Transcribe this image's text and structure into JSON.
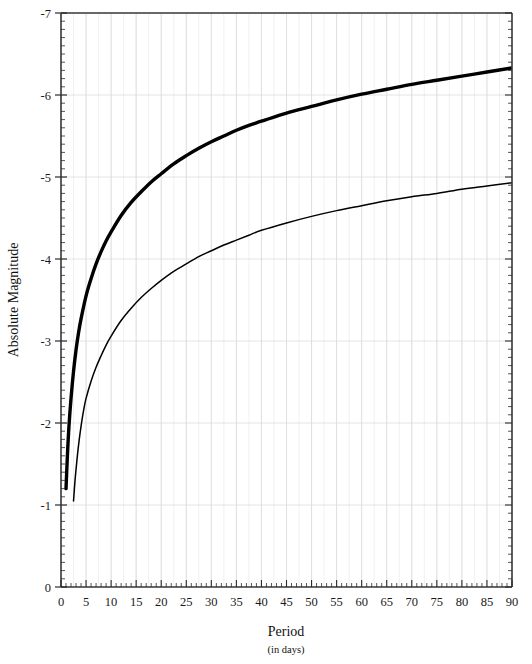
{
  "chart_data": {
    "type": "line",
    "title": "",
    "xlabel": "Period",
    "xlabel_sub": "(in days)",
    "ylabel": "Absolute Magnitude",
    "xlim": [
      0,
      90
    ],
    "ylim": [
      0,
      -7
    ],
    "y_inverted": true,
    "grid": true,
    "grid_color": "#d8d8d8",
    "legend": "none",
    "x_ticks": [
      0,
      5,
      10,
      15,
      20,
      25,
      30,
      35,
      40,
      45,
      50,
      55,
      60,
      65,
      70,
      75,
      80,
      85,
      90
    ],
    "x_tick_labels": [
      "0",
      "5",
      "10",
      "15",
      "20",
      "25",
      "30",
      "35",
      "40",
      "45",
      "50",
      "55",
      "60",
      "65",
      "70",
      "75",
      "80",
      "85",
      "90"
    ],
    "x_minor_interval": 1,
    "y_ticks": [
      0,
      -1,
      -2,
      -3,
      -4,
      -5,
      -6,
      -7
    ],
    "y_tick_labels": [
      "0",
      "-1",
      "-2",
      "-3",
      "-4",
      "-5",
      "-6",
      "-7"
    ],
    "y_minor_interval": 0.1,
    "series": [
      {
        "name": "Type I Cepheids",
        "style": "thick",
        "color": "#000000",
        "width": 3.4,
        "x": [
          1,
          1.3,
          1.6,
          2,
          2.5,
          3,
          3.5,
          4,
          5,
          6,
          7,
          8,
          9,
          10,
          12,
          14,
          16,
          18,
          20,
          22.5,
          25,
          27.5,
          30,
          32.5,
          35,
          37.5,
          40,
          45,
          50,
          55,
          60,
          65,
          70,
          75,
          80,
          85,
          90
        ],
        "y": [
          -1.2,
          -1.63,
          -1.97,
          -2.3,
          -2.63,
          -2.89,
          -3.1,
          -3.27,
          -3.55,
          -3.76,
          -3.94,
          -4.09,
          -4.22,
          -4.33,
          -4.53,
          -4.69,
          -4.82,
          -4.94,
          -5.04,
          -5.16,
          -5.26,
          -5.35,
          -5.43,
          -5.5,
          -5.57,
          -5.63,
          -5.68,
          -5.78,
          -5.86,
          -5.94,
          -6.01,
          -6.07,
          -6.13,
          -6.18,
          -6.23,
          -6.28,
          -6.33
        ]
      },
      {
        "name": "Type II Cepheids / RR Lyrae",
        "style": "thin",
        "color": "#000000",
        "width": 1.5,
        "x": [
          2.5,
          2.8,
          3.2,
          3.6,
          4,
          4.5,
          5,
          6,
          7,
          8,
          9,
          10,
          12,
          14,
          16,
          18,
          20,
          22.5,
          25,
          27.5,
          30,
          32.5,
          35,
          37.5,
          40,
          45,
          50,
          55,
          60,
          65,
          70,
          75,
          80,
          85,
          90
        ],
        "y": [
          -1.05,
          -1.3,
          -1.56,
          -1.78,
          -1.96,
          -2.15,
          -2.3,
          -2.51,
          -2.68,
          -2.82,
          -2.95,
          -3.06,
          -3.25,
          -3.4,
          -3.53,
          -3.64,
          -3.74,
          -3.85,
          -3.94,
          -4.03,
          -4.1,
          -4.17,
          -4.23,
          -4.29,
          -4.35,
          -4.44,
          -4.52,
          -4.59,
          -4.65,
          -4.71,
          -4.76,
          -4.8,
          -4.85,
          -4.89,
          -4.93
        ]
      }
    ]
  },
  "plot": {
    "frame_color": "#3a3a3a",
    "background": "#ffffff"
  }
}
